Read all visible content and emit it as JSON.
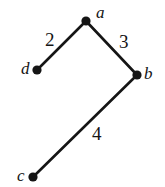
{
  "figure": {
    "type": "weighted-undirected-graph",
    "width": 165,
    "height": 187,
    "background_color": "#ffffff",
    "ink_color": "#151515",
    "edge_stroke_width": 2.6,
    "node_radius": 4.6
  },
  "nodes": [
    {
      "id": "a",
      "label": "a",
      "x": 86,
      "y": 21,
      "label_position": "upper-right"
    },
    {
      "id": "b",
      "label": "b",
      "x": 137,
      "y": 75,
      "label_position": "right"
    },
    {
      "id": "c",
      "label": "c",
      "x": 33,
      "y": 177,
      "label_position": "left"
    },
    {
      "id": "d",
      "label": "d",
      "x": 37,
      "y": 70,
      "label_position": "left"
    }
  ],
  "edges": [
    {
      "id": "d-a",
      "from": "d",
      "to": "a",
      "weight": "2",
      "label_x": 52,
      "label_y": 40
    },
    {
      "id": "a-b",
      "from": "a",
      "to": "b",
      "weight": "3",
      "label_x": 126,
      "label_y": 42
    },
    {
      "id": "b-c",
      "from": "b",
      "to": "c",
      "weight": "4",
      "label_x": 99,
      "label_y": 135
    }
  ]
}
